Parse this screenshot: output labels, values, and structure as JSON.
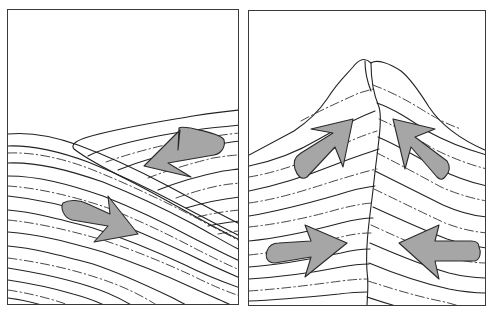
{
  "figure": {
    "panels": [
      {
        "id": "left",
        "label": "Oceanic-continental style overthrust: one plate overriding another",
        "arrows": [
          {
            "direction": "down-left",
            "description": "upper plate moving toward lower-left"
          },
          {
            "direction": "down-right",
            "description": "lower plate moving toward lower-right"
          }
        ]
      },
      {
        "id": "right",
        "label": "Continental collision forming a mountain peak",
        "arrows": [
          {
            "direction": "up-right",
            "description": "left block pushed upward"
          },
          {
            "direction": "up-left",
            "description": "right block pushed upward"
          },
          {
            "direction": "right",
            "description": "left plate converging"
          },
          {
            "direction": "left",
            "description": "right plate converging"
          }
        ]
      }
    ],
    "colors": {
      "background": "#ffffff",
      "stroke": "#222222",
      "arrow_fill": "#a6a6a6",
      "border": "#3a3a3a"
    }
  }
}
